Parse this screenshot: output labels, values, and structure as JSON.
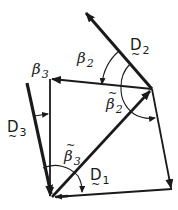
{
  "diagram": {
    "labels": {
      "D1": {
        "letter": "D",
        "subscript": "1",
        "tilde": "~"
      },
      "D2": {
        "letter": "D",
        "subscript": "2",
        "tilde": "~"
      },
      "D3": {
        "letter": "D",
        "subscript": "3",
        "tilde": "~"
      },
      "beta2": {
        "letter": "β",
        "subscript": "2"
      },
      "beta3": {
        "letter": "β",
        "subscript": "3"
      },
      "beta2_tilde": {
        "letter": "β",
        "subscript": "2",
        "tilde": "~"
      },
      "beta3_tilde": {
        "letter": "β",
        "subscript": "3",
        "tilde": "~"
      }
    },
    "colors": {
      "stroke": "#1a1a1a",
      "background": "#ffffff"
    }
  }
}
